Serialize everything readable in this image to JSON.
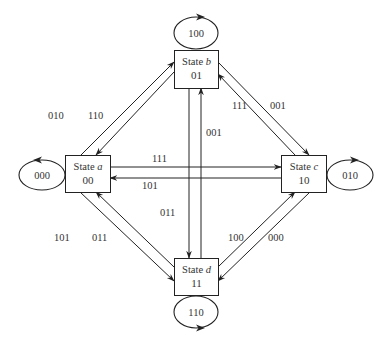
{
  "diagram": {
    "type": "state-transition-diagram",
    "states": [
      {
        "id": "a",
        "prefix": "State ",
        "var": "a",
        "code": "00",
        "box": {
          "x": 65,
          "y": 155,
          "w": 45,
          "h": 37
        }
      },
      {
        "id": "b",
        "prefix": "State ",
        "var": "b",
        "code": "01",
        "box": {
          "x": 174,
          "y": 50,
          "w": 44,
          "h": 38
        }
      },
      {
        "id": "c",
        "prefix": "State ",
        "var": "c",
        "code": "10",
        "box": {
          "x": 281,
          "y": 155,
          "w": 45,
          "h": 37
        }
      },
      {
        "id": "d",
        "prefix": "State ",
        "var": "d",
        "code": "11",
        "box": {
          "x": 174,
          "y": 258,
          "w": 44,
          "h": 37
        }
      }
    ],
    "self_loops": [
      {
        "state": "a",
        "label": "000",
        "cx": 42,
        "cy": 175,
        "rx": 23,
        "ry": 15,
        "arrow_side": "top",
        "arrow_dir": "left"
      },
      {
        "state": "b",
        "label": "100",
        "cx": 196,
        "cy": 33,
        "rx": 22,
        "ry": 16,
        "arrow_side": "top",
        "arrow_dir": "right"
      },
      {
        "state": "c",
        "label": "010",
        "cx": 350,
        "cy": 175,
        "rx": 23,
        "ry": 15,
        "arrow_side": "top",
        "arrow_dir": "right"
      },
      {
        "state": "d",
        "label": "110",
        "cx": 196,
        "cy": 312,
        "rx": 22,
        "ry": 16,
        "arrow_side": "bottom",
        "arrow_dir": "right"
      }
    ],
    "transitions": [
      {
        "from": "a",
        "to": "b",
        "label": "010",
        "x1": 81,
        "y1": 155,
        "x2": 174,
        "y2": 62,
        "lx": 48,
        "ly": 119
      },
      {
        "from": "b",
        "to": "a",
        "label": "110",
        "x1": 174,
        "y1": 72,
        "x2": 96,
        "y2": 155,
        "lx": 88,
        "ly": 119
      },
      {
        "from": "b",
        "to": "c",
        "label": "001",
        "x1": 218,
        "y1": 62,
        "x2": 309,
        "y2": 155,
        "lx": 270,
        "ly": 109
      },
      {
        "from": "c",
        "to": "b",
        "label": "111",
        "x1": 295,
        "y1": 155,
        "x2": 218,
        "y2": 74,
        "lx": 232,
        "ly": 109
      },
      {
        "from": "a",
        "to": "c",
        "label": "111",
        "x1": 110,
        "y1": 167,
        "x2": 281,
        "y2": 167,
        "lx": 152,
        "ly": 162
      },
      {
        "from": "c",
        "to": "a",
        "label": "101",
        "x1": 281,
        "y1": 178,
        "x2": 110,
        "y2": 178,
        "lx": 142,
        "ly": 189
      },
      {
        "from": "b",
        "to": "d",
        "label": "011",
        "x1": 189,
        "y1": 88,
        "x2": 189,
        "y2": 258,
        "lx": 160,
        "ly": 216
      },
      {
        "from": "d",
        "to": "b",
        "label": "001",
        "x1": 201,
        "y1": 258,
        "x2": 201,
        "y2": 88,
        "lx": 206,
        "ly": 136
      },
      {
        "from": "a",
        "to": "d",
        "label": "101",
        "x1": 80,
        "y1": 192,
        "x2": 174,
        "y2": 281,
        "lx": 54,
        "ly": 241
      },
      {
        "from": "d",
        "to": "a",
        "label": "011",
        "x1": 174,
        "y1": 267,
        "x2": 96,
        "y2": 192,
        "lx": 92,
        "ly": 241
      },
      {
        "from": "d",
        "to": "c",
        "label": "100",
        "x1": 218,
        "y1": 267,
        "x2": 295,
        "y2": 192,
        "lx": 228,
        "ly": 241
      },
      {
        "from": "c",
        "to": "d",
        "label": "000",
        "x1": 310,
        "y1": 192,
        "x2": 218,
        "y2": 281,
        "lx": 268,
        "ly": 241
      }
    ]
  }
}
